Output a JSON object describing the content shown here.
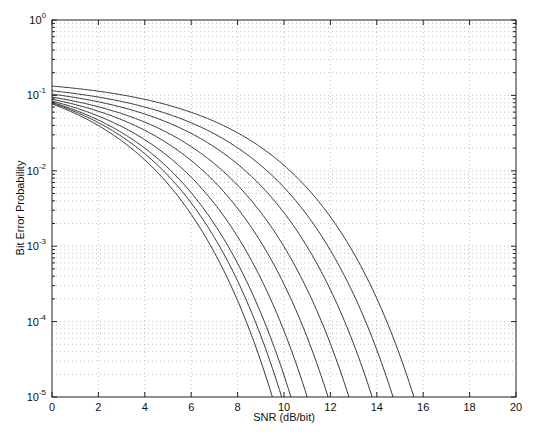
{
  "chart_data": {
    "type": "line",
    "title": "",
    "xlabel": "SNR (dB/bit)",
    "ylabel": "Bit Error Probability",
    "xlim": [
      0,
      20
    ],
    "ylim": [
      1e-05,
      1
    ],
    "yscale": "log",
    "grid": true,
    "legend": null,
    "x_ticks": [
      "0",
      "2",
      "4",
      "6",
      "8",
      "10",
      "12",
      "14",
      "16",
      "18",
      "20"
    ],
    "y_ticks": [
      {
        "base": "10",
        "exp": "0"
      },
      {
        "base": "10",
        "exp": "-1"
      },
      {
        "base": "10",
        "exp": "-2"
      },
      {
        "base": "10",
        "exp": "-3"
      },
      {
        "base": "10",
        "exp": "-4"
      },
      {
        "base": "10",
        "exp": "-5"
      }
    ],
    "x": [
      0,
      2,
      4,
      6,
      8,
      10,
      12,
      14,
      16
    ],
    "series": [
      {
        "name": "curve 1",
        "start_log10": -1.113,
        "end_snr_at_1e-5": 9.5,
        "log10_values": [
          -1.11,
          -1.4,
          -1.86,
          -2.58,
          -3.72,
          null,
          null,
          null,
          null
        ]
      },
      {
        "name": "curve 2",
        "start_log10": -1.102,
        "end_snr_at_1e-5": 9.9,
        "log10_values": [
          -1.1,
          -1.36,
          -1.77,
          -2.43,
          -3.45,
          null,
          null,
          null,
          null
        ]
      },
      {
        "name": "curve 3",
        "start_log10": -1.092,
        "end_snr_at_1e-5": 10.3,
        "log10_values": [
          -1.09,
          -1.33,
          -1.7,
          -2.29,
          -3.23,
          -4.71,
          null,
          null,
          null
        ]
      },
      {
        "name": "curve 4",
        "start_log10": -1.076,
        "end_snr_at_1e-5": 11.0,
        "log10_values": [
          -1.08,
          -1.27,
          -1.59,
          -2.09,
          -2.87,
          -4.12,
          null,
          null,
          null
        ]
      },
      {
        "name": "curve 5",
        "start_log10": -1.051,
        "end_snr_at_1e-5": 11.9,
        "log10_values": [
          -1.05,
          -1.21,
          -1.46,
          -1.86,
          -2.49,
          -3.5,
          null,
          null,
          null
        ]
      },
      {
        "name": "curve 6",
        "start_log10": -1.022,
        "end_snr_at_1e-5": 12.8,
        "log10_values": [
          -1.02,
          -1.15,
          -1.35,
          -1.68,
          -2.19,
          -3.01,
          -4.29,
          null,
          null
        ]
      },
      {
        "name": "curve 7",
        "start_log10": -0.983,
        "end_snr_at_1e-5": 13.8,
        "log10_values": [
          -0.98,
          -1.09,
          -1.25,
          -1.52,
          -1.92,
          -2.56,
          -3.58,
          null,
          null
        ]
      },
      {
        "name": "curve 8",
        "start_log10": -0.939,
        "end_snr_at_1e-5": 14.7,
        "log10_values": [
          -0.94,
          -1.02,
          -1.15,
          -1.36,
          -1.69,
          -2.22,
          -3.03,
          -4.37,
          null
        ]
      },
      {
        "name": "curve 9",
        "start_log10": -0.876,
        "end_snr_at_1e-5": 15.6,
        "log10_values": [
          -0.88,
          -0.94,
          -1.05,
          -1.22,
          -1.49,
          -1.93,
          -2.61,
          -3.69,
          null
        ]
      }
    ],
    "colors": {
      "line": "#3a3a3a",
      "axis": "#222222",
      "grid": "#9a9a9a"
    }
  }
}
